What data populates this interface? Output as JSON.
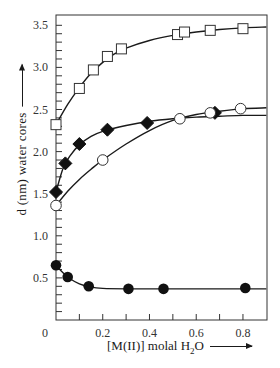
{
  "chart_data": {
    "type": "scatter",
    "title": "",
    "xlabel": "[M(II)] molal H2O",
    "xlabel_parts": {
      "pre": "[M(II)] molal H",
      "sub": "2",
      "post": "O"
    },
    "ylabel": "d (nm)  water  cores",
    "xlim": [
      0,
      0.9
    ],
    "ylim": [
      0,
      3.63
    ],
    "x_ticks": [
      0,
      0.2,
      0.4,
      0.6,
      0.8
    ],
    "x_tick_labels": [
      "0",
      "0.2",
      "0.4",
      "0.6",
      "0.8"
    ],
    "x_minor_step": 0.1,
    "y_ticks": [
      0.5,
      1.0,
      1.5,
      2.0,
      2.5,
      3.0,
      3.5
    ],
    "y_tick_labels": [
      "0.5",
      "1.0",
      "1.5",
      "2.0",
      "2.5",
      "3.0",
      "3.5"
    ],
    "y_minor_step": 0.1,
    "grid": false,
    "legend": null,
    "series": [
      {
        "name": "open squares",
        "marker": "square-open",
        "x": [
          0.0,
          0.1,
          0.16,
          0.22,
          0.28,
          0.52,
          0.55,
          0.66,
          0.8
        ],
        "y": [
          2.32,
          2.75,
          2.97,
          3.13,
          3.22,
          3.39,
          3.42,
          3.44,
          3.46
        ],
        "fit": {
          "x": [
            0.0,
            0.05,
            0.1,
            0.15,
            0.2,
            0.25,
            0.3,
            0.4,
            0.5,
            0.6,
            0.7,
            0.8,
            0.9
          ],
          "y": [
            2.32,
            2.56,
            2.76,
            2.93,
            3.06,
            3.16,
            3.23,
            3.32,
            3.38,
            3.42,
            3.45,
            3.47,
            3.48
          ]
        }
      },
      {
        "name": "filled diamonds",
        "marker": "diamond-filled",
        "x": [
          0.0,
          0.04,
          0.1,
          0.22,
          0.39,
          0.68
        ],
        "y": [
          1.52,
          1.86,
          2.09,
          2.26,
          2.34,
          2.46
        ],
        "fit": {
          "x": [
            0.0,
            0.03,
            0.06,
            0.1,
            0.15,
            0.2,
            0.3,
            0.4,
            0.5,
            0.6,
            0.7,
            0.8,
            0.9
          ],
          "y": [
            1.52,
            1.8,
            1.95,
            2.08,
            2.18,
            2.24,
            2.31,
            2.36,
            2.39,
            2.41,
            2.42,
            2.43,
            2.43
          ]
        }
      },
      {
        "name": "open circles",
        "marker": "circle-open",
        "x": [
          0.0,
          0.2,
          0.53,
          0.66,
          0.79
        ],
        "y": [
          1.36,
          1.9,
          2.39,
          2.46,
          2.51
        ],
        "fit": {
          "x": [
            0.0,
            0.05,
            0.1,
            0.15,
            0.2,
            0.3,
            0.4,
            0.5,
            0.6,
            0.7,
            0.8,
            0.9
          ],
          "y": [
            1.36,
            1.53,
            1.67,
            1.79,
            1.9,
            2.09,
            2.25,
            2.37,
            2.44,
            2.48,
            2.51,
            2.52
          ]
        }
      },
      {
        "name": "filled circles",
        "marker": "circle-filled",
        "x": [
          0.0,
          0.05,
          0.14,
          0.31,
          0.46,
          0.81
        ],
        "y": [
          0.65,
          0.51,
          0.4,
          0.37,
          0.37,
          0.38
        ],
        "fit": {
          "x": [
            0.0,
            0.03,
            0.06,
            0.1,
            0.15,
            0.2,
            0.3,
            0.5,
            0.7,
            0.9
          ],
          "y": [
            0.65,
            0.56,
            0.49,
            0.43,
            0.39,
            0.375,
            0.37,
            0.37,
            0.37,
            0.37
          ]
        }
      }
    ]
  },
  "labels": {
    "ylabel": "d (nm)  water  cores",
    "xlabel_pre": "[M(II)] molal H",
    "xlabel_sub": "2",
    "xlabel_post": "O"
  }
}
